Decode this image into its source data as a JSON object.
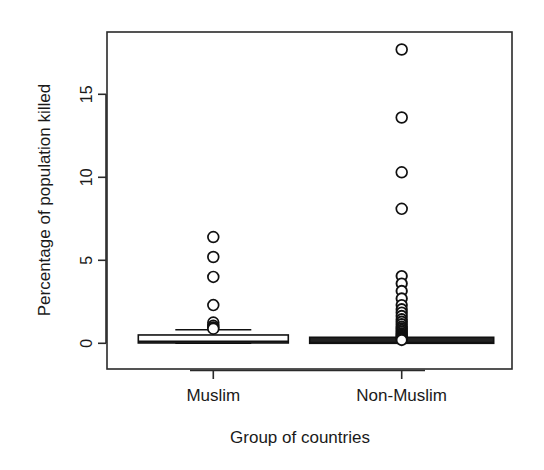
{
  "chart_data": {
    "type": "box",
    "title": "",
    "xlabel": "Group of countries",
    "ylabel": "Percentage of population killed",
    "categories": [
      "Muslim",
      "Non-Muslim"
    ],
    "ylim": [
      -0.6,
      19.6
    ],
    "yticks": [
      0,
      5,
      10,
      15
    ],
    "ytick_labels": [
      "0",
      "5",
      "10",
      "15"
    ],
    "xticks": [
      "Muslim",
      "Non-Muslim"
    ],
    "grid": false,
    "legend": null,
    "series": [
      {
        "name": "Muslim",
        "q1": 0.02,
        "median": 0.1,
        "q3": 0.22,
        "whisker_low": 0.0,
        "whisker_high": 0.82,
        "outliers": [
          6.4,
          5.2,
          4.0,
          2.3,
          1.25,
          1.05,
          0.95,
          0.88
        ]
      },
      {
        "name": "Non-Muslim",
        "q1": 0.0,
        "median": 0.02,
        "q3": 0.1,
        "whisker_low": 0.0,
        "whisker_high": 0.25,
        "outliers": [
          17.7,
          13.6,
          10.3,
          8.1,
          4.05,
          3.6,
          3.15,
          2.7,
          2.3,
          2.05,
          1.85,
          1.65,
          1.45,
          1.3,
          1.15,
          1.0,
          0.9,
          0.8,
          0.7,
          0.6,
          0.52,
          0.45,
          0.38,
          0.32,
          0.26,
          0.2
        ]
      }
    ]
  },
  "axes": {
    "ylabel": "Percentage of population killed",
    "xlabel": "Group of countries",
    "ytick_0": "0",
    "ytick_5": "5",
    "ytick_10": "10",
    "ytick_15": "15",
    "xtick_1": "Muslim",
    "xtick_2": "Non-Muslim"
  },
  "colors": {
    "background": "#ffffff",
    "ink": "#1a1a1a",
    "box_fill": "#ffffff",
    "box_stroke": "#111111",
    "dense_fill": "#222222"
  }
}
